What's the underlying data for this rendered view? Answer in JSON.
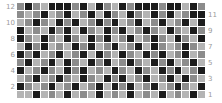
{
  "figure": {
    "background_color": "#ffffff",
    "gridline_color": "#ffffff"
  },
  "axes": {
    "left": {
      "name": "left-y-axis",
      "ticks": [
        "2",
        "4",
        "6",
        "8",
        "10",
        "12"
      ],
      "tick_color": "#9a9a9a"
    },
    "right": {
      "name": "right-y-axis",
      "ticks": [
        "1",
        "3",
        "5",
        "7",
        "9",
        "11"
      ],
      "tick_color": "#9a9a9a"
    }
  },
  "chart_data": {
    "type": "heatmap",
    "title": "",
    "xlabel": "",
    "ylabel": "",
    "colormap": "gray",
    "grid": true,
    "legend": "none",
    "n_rows": 12,
    "n_cols": 24,
    "left_tick_labels": [
      "2",
      "4",
      "6",
      "8",
      "10",
      "12"
    ],
    "right_tick_labels": [
      "1",
      "3",
      "5",
      "7",
      "9",
      "11"
    ],
    "row_labels_top_to_bottom": [
      "12",
      "11",
      "10",
      "9",
      "8",
      "7",
      "6",
      "5",
      "4",
      "3",
      "2",
      "1"
    ],
    "value_levels": [
      0,
      1,
      2
    ],
    "level_colors": [
      "#1c1c1c",
      "#8c8c8c",
      "#b4b4b4"
    ],
    "vmin": 0,
    "vmax": 2,
    "values": [
      [
        1,
        0,
        1,
        2,
        0,
        0,
        0,
        1,
        0,
        2,
        0,
        1,
        2,
        0,
        1,
        0,
        0,
        0,
        1,
        0,
        0,
        2,
        0,
        1
      ],
      [
        1,
        2,
        1,
        0,
        2,
        1,
        0,
        2,
        1,
        0,
        2,
        0,
        1,
        2,
        0,
        1,
        2,
        0,
        1,
        0,
        2,
        1,
        0,
        0
      ],
      [
        2,
        1,
        0,
        1,
        2,
        0,
        1,
        0,
        2,
        1,
        0,
        1,
        0,
        2,
        1,
        0,
        2,
        1,
        0,
        2,
        1,
        0,
        2,
        0
      ],
      [
        0,
        2,
        1,
        2,
        0,
        1,
        0,
        2,
        0,
        1,
        2,
        0,
        1,
        0,
        2,
        1,
        0,
        1,
        2,
        0,
        1,
        2,
        0,
        1
      ],
      [
        0,
        1,
        2,
        0,
        1,
        2,
        0,
        1,
        2,
        0,
        1,
        0,
        2,
        1,
        0,
        2,
        1,
        0,
        1,
        2,
        0,
        1,
        2,
        0
      ],
      [
        2,
        0,
        1,
        0,
        2,
        1,
        2,
        0,
        1,
        0,
        2,
        1,
        0,
        2,
        1,
        0,
        2,
        0,
        1,
        2,
        1,
        0,
        1,
        2
      ],
      [
        0,
        1,
        0,
        2,
        1,
        0,
        2,
        1,
        0,
        2,
        0,
        1,
        2,
        0,
        1,
        2,
        0,
        1,
        0,
        2,
        1,
        0,
        2,
        1
      ],
      [
        1,
        0,
        2,
        1,
        0,
        2,
        0,
        1,
        2,
        0,
        1,
        0,
        2,
        1,
        0,
        1,
        2,
        0,
        1,
        0,
        2,
        1,
        0,
        2
      ],
      [
        0,
        2,
        1,
        0,
        1,
        2,
        0,
        1,
        0,
        2,
        1,
        2,
        0,
        1,
        2,
        0,
        1,
        2,
        0,
        1,
        0,
        2,
        1,
        0
      ],
      [
        2,
        1,
        0,
        2,
        1,
        0,
        1,
        2,
        0,
        1,
        2,
        0,
        1,
        0,
        2,
        1,
        0,
        2,
        1,
        0,
        2,
        0,
        1,
        2
      ],
      [
        0,
        1,
        2,
        1,
        0,
        2,
        1,
        0,
        2,
        1,
        0,
        2,
        0,
        1,
        0,
        2,
        1,
        0,
        2,
        1,
        0,
        1,
        2,
        0
      ],
      [
        2,
        2,
        0,
        2,
        1,
        2,
        0,
        2,
        1,
        2,
        0,
        2,
        1,
        2,
        0,
        2,
        1,
        2,
        0,
        2,
        1,
        2,
        0,
        2
      ]
    ]
  }
}
